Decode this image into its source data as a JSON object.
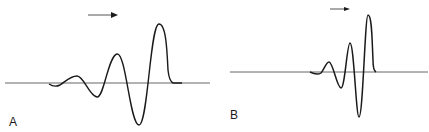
{
  "figure": {
    "panels": [
      {
        "id": "A",
        "label": "A",
        "description": "Waveform with gradually increasing oscillation amplitude, propagating left to right",
        "arrow_direction": "right"
      },
      {
        "id": "B",
        "label": "B",
        "description": "Compressed waveform with more rapidly increasing oscillation amplitude, propagating left to right",
        "arrow_direction": "right"
      }
    ],
    "colors": {
      "stroke": "#1a1a1a",
      "baseline": "#555555",
      "background": "#ffffff"
    }
  }
}
